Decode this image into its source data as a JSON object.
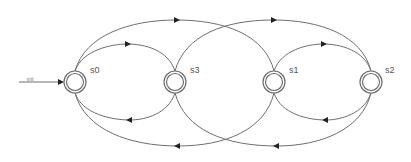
{
  "diagram": {
    "type": "state-machine",
    "colors": {
      "edge": "#6e6e6e",
      "state_stroke": "#6e6e6e",
      "arrow": "#222222",
      "label": "#555555"
    },
    "initial": {
      "label": "init",
      "target": "s0"
    },
    "states": [
      {
        "id": "s0",
        "label": "s0",
        "cx": 75,
        "cy": 82,
        "accepting": true
      },
      {
        "id": "s3",
        "label": "s3",
        "cx": 175,
        "cy": 82,
        "accepting": true
      },
      {
        "id": "s1",
        "label": "s1",
        "cx": 274,
        "cy": 82,
        "accepting": true
      },
      {
        "id": "s2",
        "label": "s2",
        "cx": 371,
        "cy": 82,
        "accepting": true
      }
    ],
    "transitions": [
      {
        "from": "s0",
        "to": "s3",
        "side": "top",
        "size": "small"
      },
      {
        "from": "s0",
        "to": "s1",
        "side": "top",
        "size": "large"
      },
      {
        "from": "s3",
        "to": "s2",
        "side": "top",
        "size": "large"
      },
      {
        "from": "s1",
        "to": "s2",
        "side": "top",
        "size": "small"
      },
      {
        "from": "s3",
        "to": "s0",
        "side": "bottom",
        "size": "small"
      },
      {
        "from": "s1",
        "to": "s0",
        "side": "bottom",
        "size": "large"
      },
      {
        "from": "s2",
        "to": "s3",
        "side": "bottom",
        "size": "large"
      },
      {
        "from": "s2",
        "to": "s1",
        "side": "bottom",
        "size": "small"
      }
    ]
  }
}
